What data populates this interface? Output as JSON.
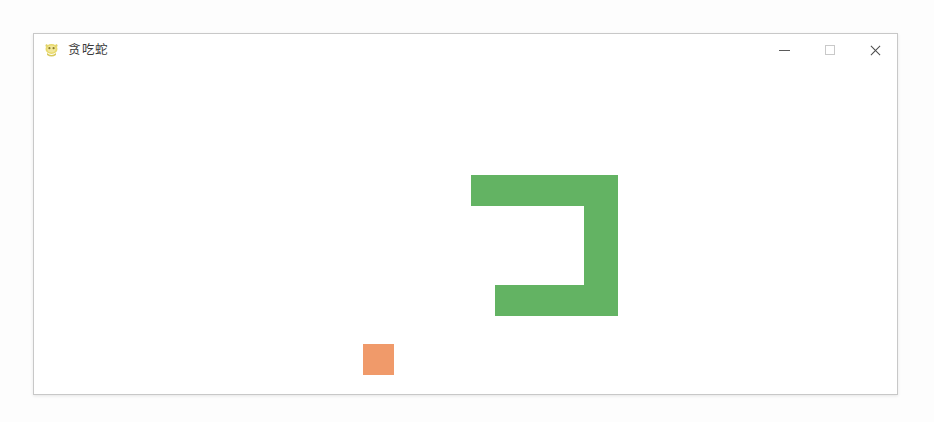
{
  "window": {
    "title": "贪吃蛇",
    "icon": "snake-app-icon",
    "bounds": {
      "left": 33,
      "top": 33,
      "width": 865,
      "height": 362
    },
    "controls": [
      {
        "name": "minimize-button",
        "glyph": "minimize-icon",
        "label": "—"
      },
      {
        "name": "maximize-button",
        "glyph": "maximize-icon",
        "label": "▢"
      },
      {
        "name": "close-button",
        "glyph": "close-icon",
        "label": "✕"
      }
    ]
  },
  "theme": {
    "snake_color": "#63b363",
    "food_color": "#f09a6a",
    "board_background": "#ffffff",
    "window_border": "#c8c8c8",
    "title_text_color": "#3a3a3a",
    "desktop_background": "#fdfdfd"
  },
  "game": {
    "cell_size": 31,
    "snake": {
      "color": "#63b363",
      "shape": "hook",
      "segments": [
        {
          "x": 437,
          "y": 109,
          "w": 147,
          "h": 31
        },
        {
          "x": 550,
          "y": 109,
          "w": 34,
          "h": 141
        },
        {
          "x": 461,
          "y": 219,
          "w": 123,
          "h": 31
        }
      ]
    },
    "food": {
      "color": "#f09a6a",
      "x": 329,
      "y": 278,
      "w": 31,
      "h": 31
    }
  }
}
